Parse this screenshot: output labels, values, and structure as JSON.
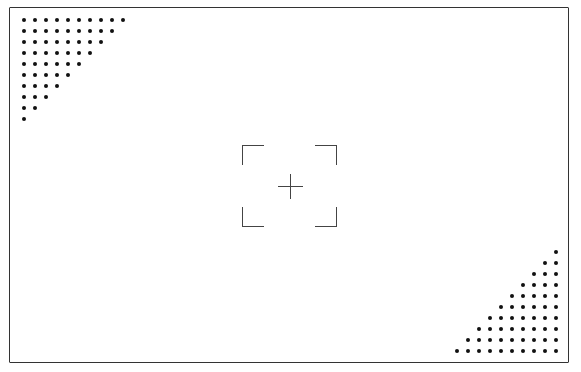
{
  "viewfinder": {
    "description": "Camera viewfinder overlay with autofocus brackets and center crosshair",
    "top_left_pattern": {
      "type": "dot-triangle",
      "rows": [
        10,
        9,
        8,
        7,
        6,
        5,
        4,
        3,
        2,
        1
      ]
    },
    "bottom_right_pattern": {
      "type": "dot-triangle",
      "rows": [
        1,
        2,
        3,
        4,
        5,
        6,
        7,
        8,
        9,
        10
      ]
    },
    "colors": {
      "frame": "#333333",
      "dots": "#111111",
      "brackets": "#444444",
      "background": "#ffffff"
    }
  }
}
